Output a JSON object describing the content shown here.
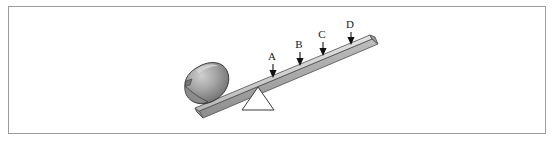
{
  "figure": {
    "frame": {
      "border_color": "#9b9b9b",
      "background_color": "#ffffff"
    },
    "colors": {
      "plank_light": "#d8d8d8",
      "plank_mid": "#b2b2b2",
      "plank_dark": "#8a8a8a",
      "plank_outline": "#4d4d4d",
      "rock_light": "#c9c9c9",
      "rock_mid": "#9a9a9a",
      "rock_dark": "#5e5e5e",
      "rock_outline": "#2b2b2b",
      "fulcrum_fill": "#ffffff",
      "fulcrum_outline": "#3a3a3a",
      "arrow_color": "#111111",
      "label_color": "#1a1a1a"
    },
    "objects": {
      "plank_label": "lever plank",
      "rock_label": "rock",
      "fulcrum_label": "fulcrum"
    },
    "markers": [
      {
        "id": "A",
        "label": "A",
        "label_x": 272,
        "label_y": 60,
        "arrow_x": 273,
        "arrow_top": 64,
        "arrow_tip": 77
      },
      {
        "id": "B",
        "label": "B",
        "label_x": 299,
        "label_y": 48,
        "arrow_x": 300,
        "arrow_top": 52,
        "arrow_tip": 65
      },
      {
        "id": "C",
        "label": "C",
        "label_x": 322,
        "label_y": 38,
        "arrow_x": 323,
        "arrow_top": 42,
        "arrow_tip": 55
      },
      {
        "id": "D",
        "label": "D",
        "label_x": 350,
        "label_y": 28,
        "arrow_x": 351,
        "arrow_top": 32,
        "arrow_tip": 44
      }
    ]
  }
}
